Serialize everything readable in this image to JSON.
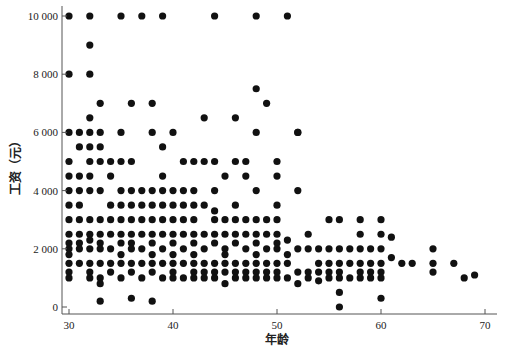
{
  "chart_data": {
    "type": "scatter",
    "title": "",
    "xlabel": "年龄",
    "ylabel": "工资（元）",
    "xlim": [
      29,
      71
    ],
    "ylim": [
      -250,
      10300
    ],
    "x_ticks": [
      30,
      40,
      50,
      60,
      70
    ],
    "x_tick_labels": [
      "30",
      "40",
      "50",
      "60",
      "70"
    ],
    "y_ticks": [
      0,
      2000,
      4000,
      6000,
      8000,
      10000
    ],
    "y_tick_labels": [
      "0",
      "2 000",
      "4 000",
      "6 000",
      "8 000",
      "10 000"
    ],
    "grid": false,
    "legend": null,
    "marker_color": "#111111",
    "series": [
      {
        "name": "工资",
        "points": [
          [
            30,
            10000
          ],
          [
            32,
            10000
          ],
          [
            35,
            10000
          ],
          [
            37,
            10000
          ],
          [
            39,
            10000
          ],
          [
            44,
            10000
          ],
          [
            48,
            10000
          ],
          [
            51,
            10000
          ],
          [
            32,
            9000
          ],
          [
            30,
            8000
          ],
          [
            32,
            8000
          ],
          [
            33,
            7000
          ],
          [
            36,
            7000
          ],
          [
            38,
            7000
          ],
          [
            49,
            7000
          ],
          [
            52,
            6000
          ],
          [
            48,
            7500
          ],
          [
            32,
            6500
          ],
          [
            43,
            6500
          ],
          [
            46,
            6500
          ],
          [
            30,
            6000
          ],
          [
            31,
            6000
          ],
          [
            32,
            6000
          ],
          [
            33,
            6000
          ],
          [
            35,
            6000
          ],
          [
            38,
            6000
          ],
          [
            40,
            6000
          ],
          [
            48,
            6000
          ],
          [
            52,
            6000
          ],
          [
            31,
            5500
          ],
          [
            32,
            5500
          ],
          [
            33,
            5500
          ],
          [
            39,
            5500
          ],
          [
            47,
            5000
          ],
          [
            30,
            5000
          ],
          [
            32,
            5000
          ],
          [
            33,
            5000
          ],
          [
            34,
            5000
          ],
          [
            35,
            5000
          ],
          [
            36,
            5000
          ],
          [
            41,
            5000
          ],
          [
            42,
            5000
          ],
          [
            43,
            5000
          ],
          [
            44,
            5000
          ],
          [
            46,
            5000
          ],
          [
            50,
            5000
          ],
          [
            30,
            4500
          ],
          [
            31,
            4500
          ],
          [
            32,
            4500
          ],
          [
            34,
            4500
          ],
          [
            39,
            4500
          ],
          [
            45,
            4500
          ],
          [
            47,
            4500
          ],
          [
            50,
            4500
          ],
          [
            30,
            4000
          ],
          [
            31,
            4000
          ],
          [
            32,
            4000
          ],
          [
            33,
            4000
          ],
          [
            35,
            4000
          ],
          [
            36,
            4000
          ],
          [
            37,
            4000
          ],
          [
            38,
            4000
          ],
          [
            39,
            4000
          ],
          [
            40,
            4000
          ],
          [
            41,
            4000
          ],
          [
            42,
            4000
          ],
          [
            44,
            4000
          ],
          [
            48,
            4000
          ],
          [
            52,
            4000
          ],
          [
            30,
            3500
          ],
          [
            31,
            3500
          ],
          [
            34,
            3500
          ],
          [
            35,
            3500
          ],
          [
            36,
            3500
          ],
          [
            37,
            3500
          ],
          [
            38,
            3500
          ],
          [
            39,
            3500
          ],
          [
            40,
            3500
          ],
          [
            41,
            3500
          ],
          [
            42,
            3500
          ],
          [
            43,
            3500
          ],
          [
            44,
            3300
          ],
          [
            46,
            3500
          ],
          [
            50,
            3500
          ],
          [
            30,
            3000
          ],
          [
            31,
            3000
          ],
          [
            32,
            3000
          ],
          [
            33,
            3000
          ],
          [
            34,
            3000
          ],
          [
            35,
            3000
          ],
          [
            36,
            3000
          ],
          [
            37,
            3000
          ],
          [
            38,
            3000
          ],
          [
            39,
            3000
          ],
          [
            40,
            3000
          ],
          [
            41,
            3000
          ],
          [
            42,
            3000
          ],
          [
            44,
            3000
          ],
          [
            45,
            3000
          ],
          [
            46,
            3000
          ],
          [
            47,
            3000
          ],
          [
            48,
            3000
          ],
          [
            49,
            3000
          ],
          [
            50,
            3000
          ],
          [
            55,
            3000
          ],
          [
            56,
            3000
          ],
          [
            58,
            3000
          ],
          [
            60,
            3000
          ],
          [
            30,
            2500
          ],
          [
            31,
            2500
          ],
          [
            32,
            2500
          ],
          [
            33,
            2500
          ],
          [
            34,
            2500
          ],
          [
            35,
            2500
          ],
          [
            36,
            2500
          ],
          [
            37,
            2500
          ],
          [
            38,
            2500
          ],
          [
            39,
            2500
          ],
          [
            40,
            2500
          ],
          [
            41,
            2500
          ],
          [
            42,
            2500
          ],
          [
            43,
            2500
          ],
          [
            44,
            2500
          ],
          [
            45,
            2500
          ],
          [
            46,
            2500
          ],
          [
            47,
            2500
          ],
          [
            48,
            2500
          ],
          [
            49,
            2500
          ],
          [
            50,
            2500
          ],
          [
            51,
            2300
          ],
          [
            53,
            2500
          ],
          [
            58,
            2500
          ],
          [
            60,
            2500
          ],
          [
            61,
            2400
          ],
          [
            30,
            2200
          ],
          [
            30,
            2000
          ],
          [
            30,
            1800
          ],
          [
            31,
            2200
          ],
          [
            31,
            2000
          ],
          [
            32,
            2300
          ],
          [
            32,
            2000
          ],
          [
            33,
            2200
          ],
          [
            33,
            2000
          ],
          [
            34,
            2000
          ],
          [
            35,
            2200
          ],
          [
            35,
            1800
          ],
          [
            36,
            2200
          ],
          [
            36,
            2000
          ],
          [
            37,
            2000
          ],
          [
            38,
            2200
          ],
          [
            38,
            1800
          ],
          [
            39,
            2000
          ],
          [
            40,
            2200
          ],
          [
            40,
            1800
          ],
          [
            41,
            2000
          ],
          [
            42,
            2200
          ],
          [
            42,
            1800
          ],
          [
            43,
            2000
          ],
          [
            44,
            2200
          ],
          [
            45,
            2000
          ],
          [
            45,
            1800
          ],
          [
            46,
            2200
          ],
          [
            47,
            2000
          ],
          [
            48,
            2200
          ],
          [
            48,
            1800
          ],
          [
            49,
            2000
          ],
          [
            50,
            2200
          ],
          [
            50,
            2000
          ],
          [
            51,
            1800
          ],
          [
            52,
            2000
          ],
          [
            53,
            2000
          ],
          [
            54,
            2000
          ],
          [
            55,
            2000
          ],
          [
            56,
            2000
          ],
          [
            57,
            2000
          ],
          [
            58,
            2000
          ],
          [
            59,
            2000
          ],
          [
            60,
            2000
          ],
          [
            61,
            1700
          ],
          [
            63,
            1500
          ],
          [
            65,
            2000
          ],
          [
            67,
            1500
          ],
          [
            30,
            1500
          ],
          [
            30,
            1200
          ],
          [
            30,
            1000
          ],
          [
            31,
            1500
          ],
          [
            32,
            1500
          ],
          [
            32,
            1200
          ],
          [
            32,
            1000
          ],
          [
            33,
            1500
          ],
          [
            33,
            1000
          ],
          [
            33,
            800
          ],
          [
            34,
            1500
          ],
          [
            34,
            1200
          ],
          [
            35,
            1500
          ],
          [
            35,
            1000
          ],
          [
            36,
            1500
          ],
          [
            36,
            1200
          ],
          [
            37,
            1500
          ],
          [
            37,
            1000
          ],
          [
            38,
            1500
          ],
          [
            38,
            1200
          ],
          [
            39,
            1500
          ],
          [
            39,
            1000
          ],
          [
            40,
            1500
          ],
          [
            40,
            1200
          ],
          [
            40,
            1000
          ],
          [
            41,
            1500
          ],
          [
            41,
            1000
          ],
          [
            42,
            1500
          ],
          [
            42,
            1200
          ],
          [
            42,
            1000
          ],
          [
            43,
            1500
          ],
          [
            43,
            1200
          ],
          [
            43,
            1000
          ],
          [
            44,
            1500
          ],
          [
            44,
            1200
          ],
          [
            44,
            1000
          ],
          [
            45,
            1500
          ],
          [
            45,
            1200
          ],
          [
            45,
            800
          ],
          [
            46,
            1500
          ],
          [
            46,
            1200
          ],
          [
            46,
            1000
          ],
          [
            47,
            1500
          ],
          [
            47,
            1200
          ],
          [
            47,
            1000
          ],
          [
            48,
            1500
          ],
          [
            48,
            1200
          ],
          [
            48,
            1000
          ],
          [
            49,
            1500
          ],
          [
            49,
            1200
          ],
          [
            49,
            1000
          ],
          [
            50,
            1500
          ],
          [
            50,
            1200
          ],
          [
            50,
            1000
          ],
          [
            51,
            1500
          ],
          [
            51,
            1000
          ],
          [
            52,
            1200
          ],
          [
            52,
            800
          ],
          [
            53,
            1200
          ],
          [
            53,
            1000
          ],
          [
            54,
            1500
          ],
          [
            54,
            1200
          ],
          [
            54,
            900
          ],
          [
            55,
            1500
          ],
          [
            55,
            1200
          ],
          [
            55,
            1000
          ],
          [
            56,
            1500
          ],
          [
            56,
            1200
          ],
          [
            56,
            1000
          ],
          [
            57,
            1500
          ],
          [
            57,
            1000
          ],
          [
            58,
            1500
          ],
          [
            58,
            1200
          ],
          [
            58,
            1000
          ],
          [
            59,
            1500
          ],
          [
            59,
            1200
          ],
          [
            59,
            1000
          ],
          [
            60,
            1500
          ],
          [
            60,
            1200
          ],
          [
            60,
            1000
          ],
          [
            62,
            1500
          ],
          [
            65,
            1500
          ],
          [
            65,
            1200
          ],
          [
            68,
            1000
          ],
          [
            69,
            1100
          ],
          [
            33,
            200
          ],
          [
            36,
            300
          ],
          [
            38,
            200
          ],
          [
            56,
            500
          ],
          [
            56,
            0
          ],
          [
            60,
            300
          ]
        ]
      }
    ]
  }
}
